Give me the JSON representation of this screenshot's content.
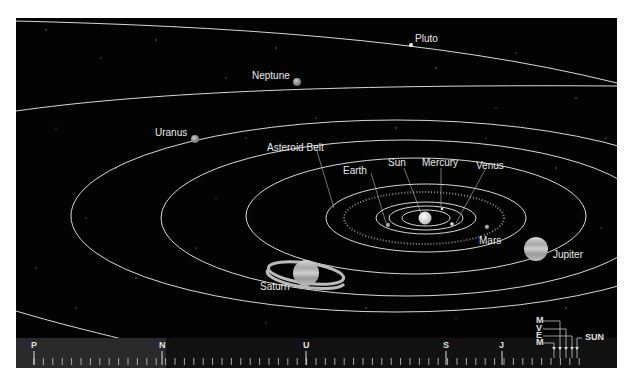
{
  "figure": {
    "background_color": "#030303",
    "orbit_color": "#d8d8d8"
  },
  "labels": {
    "pluto": "Pluto",
    "neptune": "Neptune",
    "uranus": "Uranus",
    "asteroid_belt": "Asteroid Belt",
    "earth": "Earth",
    "sun": "Sun",
    "mercury": "Mercury",
    "venus": "Venus",
    "mars": "Mars",
    "jupiter": "Jupiter",
    "saturn": "Saturn"
  },
  "scale_bar": {
    "letters": [
      "P",
      "N",
      "U",
      "S",
      "J"
    ],
    "inner_letters": [
      "M",
      "V",
      "E",
      "M"
    ],
    "sun_label": "SUN"
  },
  "caption": ""
}
